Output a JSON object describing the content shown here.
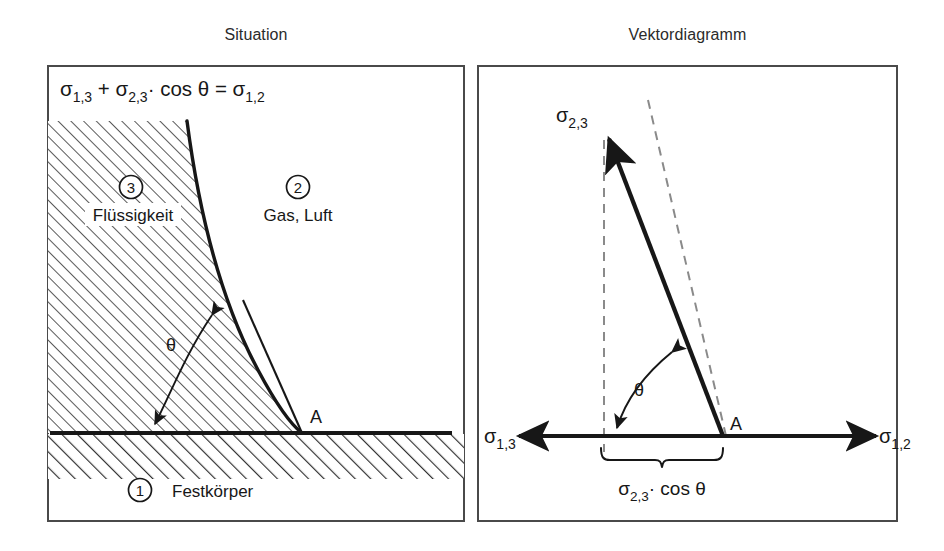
{
  "figure": {
    "type": "scientific-diagram",
    "language": "de"
  },
  "panels": {
    "left": {
      "title": "Situation",
      "equation": "σ₁,₃ + σ₂,₃ · cos θ = σ₁,₂",
      "equation_parts": {
        "term1_sym": "σ",
        "term1_sub": "1,3",
        "plus": "+",
        "term2_sym": "σ",
        "term2_sub": "2,3",
        "dot": "·",
        "cos": "cos",
        "theta": "θ",
        "equals": "=",
        "term3_sym": "σ",
        "term3_sub": "1,2"
      },
      "regions": [
        {
          "number": "3",
          "label": "Flüssigkeit",
          "kind": "liquid"
        },
        {
          "number": "2",
          "label": "Gas, Luft",
          "kind": "gas"
        },
        {
          "number": "1",
          "label": "Festkörper",
          "kind": "solid"
        }
      ],
      "angle_label": "θ",
      "contact_point_label": "A"
    },
    "right": {
      "title": "Vektordiagramm",
      "vectors": [
        {
          "name": "sigma-2-3",
          "sym": "σ",
          "sub": "2,3",
          "direction": "up-left"
        },
        {
          "name": "sigma-1-3",
          "sym": "σ",
          "sub": "1,3",
          "direction": "left"
        },
        {
          "name": "sigma-1-2",
          "sym": "σ",
          "sub": "1,2",
          "direction": "right"
        }
      ],
      "angle_label": "θ",
      "contact_point_label": "A",
      "brace_label": {
        "sym": "σ",
        "sub": "2,3",
        "dot": "·",
        "cos": "cos",
        "theta": "θ",
        "full": "σ₂,₃ · cos θ"
      }
    }
  },
  "colors": {
    "ink": "#171717",
    "frame": "#4a4a4a",
    "hatch": "#3a3a3a",
    "background": "#ffffff"
  }
}
